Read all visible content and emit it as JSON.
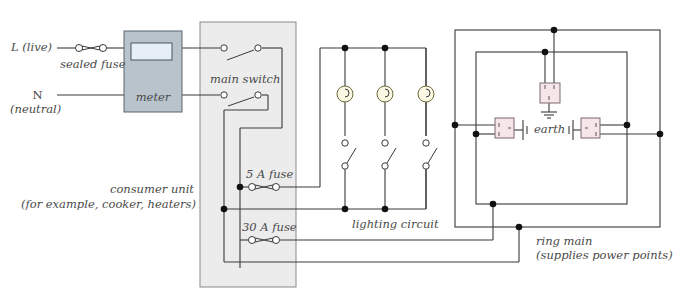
{
  "diagram": {
    "colors": {
      "wire": "#3a3a3a",
      "consumer_unit_fill": "#ececec",
      "consumer_unit_border": "#8a8a8a",
      "meter_fill": "#b9c3cc",
      "meter_display": "#e6eef7",
      "lamp_fill": "#fbf9e4",
      "socket_fill": "#f6e6ea",
      "label_text": "#4a4a4a"
    },
    "labels": {
      "live": "L (live)",
      "sealed_fuse": "sealed fuse",
      "neutral_n": "N",
      "neutral": "(neutral)",
      "meter": "meter",
      "main_switch": "main switch",
      "fuse_5a": "5 A fuse",
      "fuse_30a": "30 A fuse",
      "consumer_unit_line1": "consumer unit",
      "consumer_unit_line2": "(for example, cooker, heaters)",
      "lighting_circuit": "lighting circuit",
      "earth": "earth",
      "ring_main_line1": "ring main",
      "ring_main_line2": "(supplies power points)"
    },
    "components": {
      "lamps": 3,
      "light_switches": 3,
      "sockets": 3,
      "fuses": [
        "sealed fuse",
        "5 A fuse",
        "30 A fuse"
      ]
    }
  }
}
